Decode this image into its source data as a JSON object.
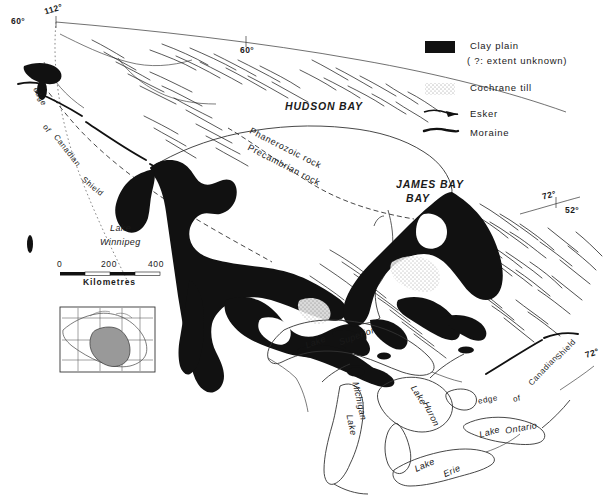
{
  "figure": {
    "background_color": "#ffffff",
    "ink_color": "#111111"
  },
  "legend": {
    "items": [
      {
        "symbol": "filled-rectangle",
        "label": "Clay plain",
        "sublabel": "( ?: extent unknown)"
      },
      {
        "symbol": "stipple",
        "label": "Cochrane till",
        "sublabel": ""
      },
      {
        "symbol": "esker-line",
        "label": "Esker",
        "sublabel": ""
      },
      {
        "symbol": "moraine-line",
        "label": "Moraine",
        "sublabel": ""
      }
    ]
  },
  "coordinates": [
    {
      "label": "112°",
      "x": 48,
      "y": 6
    },
    {
      "label": "60°",
      "x": 14,
      "y": 16
    },
    {
      "label": "60°",
      "x": 240,
      "y": 49
    },
    {
      "label": "72°",
      "x": 545,
      "y": 194
    },
    {
      "label": "52°",
      "x": 566,
      "y": 208
    },
    {
      "label": "72°",
      "x": 588,
      "y": 352
    }
  ],
  "water_bodies": [
    {
      "name": "HUDSON BAY",
      "style": "bay",
      "x": 292,
      "y": 104
    },
    {
      "name": "JAMES BAY",
      "style": "bay-line1",
      "x": 399,
      "y": 183
    },
    {
      "name": "BAY",
      "style": "bay-line2",
      "x": 409,
      "y": 196
    },
    {
      "name": "Lake",
      "style": "lake",
      "x": 113,
      "y": 228
    },
    {
      "name": "Winnipeg",
      "style": "lake",
      "x": 104,
      "y": 241
    },
    {
      "name": "Lake",
      "style": "lake",
      "x": 311,
      "y": 340
    },
    {
      "name": "Superior",
      "style": "lake",
      "x": 345,
      "y": 337
    },
    {
      "name": "Lake",
      "style": "lake",
      "x": 413,
      "y": 395
    },
    {
      "name": "Huron",
      "style": "lake",
      "x": 425,
      "y": 414
    },
    {
      "name": "Lake",
      "style": "lake",
      "x": 347,
      "y": 424
    },
    {
      "name": "Michigan",
      "style": "lake",
      "x": 352,
      "y": 400
    },
    {
      "name": "Lake",
      "style": "lake",
      "x": 486,
      "y": 430
    },
    {
      "name": "Ontario",
      "style": "lake",
      "x": 512,
      "y": 428
    },
    {
      "name": "Lake",
      "style": "lake",
      "x": 420,
      "y": 463
    },
    {
      "name": "Erie",
      "style": "lake",
      "x": 447,
      "y": 470
    }
  ],
  "geology_labels": [
    {
      "text": "Phanerozoic  rock",
      "x": 248,
      "y": 148
    },
    {
      "text": "Precambrian  rock",
      "x": 248,
      "y": 165
    }
  ],
  "boundary_labels": [
    {
      "text": "edge",
      "x": 33,
      "y": 96
    },
    {
      "text": "of",
      "x": 45,
      "y": 128
    },
    {
      "text": "Canadian",
      "x": 51,
      "y": 150
    },
    {
      "text": "Shield",
      "x": 83,
      "y": 186
    },
    {
      "text": "edge",
      "x": 481,
      "y": 399
    },
    {
      "text": "of",
      "x": 516,
      "y": 398
    },
    {
      "text": "Canadian",
      "x": 528,
      "y": 370
    },
    {
      "text": "Shield",
      "x": 556,
      "y": 349
    }
  ],
  "scale_bar": {
    "title": "Kilometres",
    "ticks": [
      "0",
      "200",
      "400"
    ],
    "x": 60,
    "y": 262,
    "width": 100
  },
  "inset": {
    "name": "locator-map-of-canada",
    "x": 60,
    "y": 307,
    "width": 95,
    "height": 65
  }
}
